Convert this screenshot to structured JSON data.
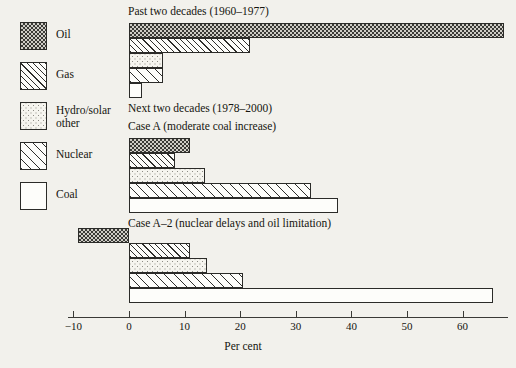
{
  "legend": {
    "items": [
      {
        "key": "oil",
        "label": "Oil",
        "pattern": "checkerboard"
      },
      {
        "key": "gas",
        "label": "Gas",
        "pattern": "diagonal-hatch-tight"
      },
      {
        "key": "hydro",
        "label": "Hydro/solar\nother",
        "pattern": "stipple-dots"
      },
      {
        "key": "nuclear",
        "label": "Nuclear",
        "pattern": "diagonal-hatch-wide"
      },
      {
        "key": "coal",
        "label": "Coal",
        "pattern": "plain-white"
      }
    ]
  },
  "axis": {
    "title": "Per cent",
    "ticks": [
      -10,
      0,
      10,
      20,
      30,
      40,
      50,
      60
    ],
    "tick_labels": [
      "−10",
      "0",
      "10",
      "20",
      "30",
      "40",
      "50",
      "60"
    ],
    "min": -10,
    "max": 66.5
  },
  "groups": [
    {
      "id": "past",
      "title": "Past two decades (1960–1977)",
      "subtitle": ""
    },
    {
      "id": "case-a",
      "title": "Next two decades (1978–2000)",
      "subtitle": "Case A (moderate coal increase)"
    },
    {
      "id": "case-a2",
      "title": "",
      "subtitle": "Case A–2 (nuclear delays and oil limitation)"
    }
  ],
  "chart_data": {
    "type": "bar",
    "orientation": "horizontal",
    "title": "",
    "xlabel": "Per cent",
    "ylabel": "",
    "xlim": [
      -10,
      66.5
    ],
    "grid": false,
    "legend_position": "left",
    "categories": [
      "Oil",
      "Gas",
      "Hydro/solar other",
      "Nuclear",
      "Coal"
    ],
    "series": [
      {
        "name": "Past two decades (1960–1977)",
        "values": [
          67.5,
          21.7,
          6.2,
          6.2,
          2.4
        ]
      },
      {
        "name": "Case A (moderate coal increase)",
        "values": [
          11.0,
          8.3,
          13.7,
          32.8,
          37.5
        ]
      },
      {
        "name": "Case A–2 (nuclear delays and oil limitation)",
        "values": [
          -9.2,
          11.0,
          14.0,
          20.5,
          65.5
        ]
      }
    ]
  }
}
